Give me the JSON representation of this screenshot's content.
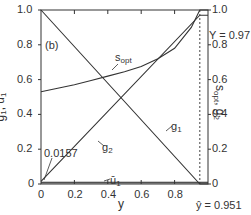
{
  "chart_data": {
    "type": "line",
    "panel_label": "(b)",
    "xlabel": "y",
    "ylabel_left": "g1, ū1",
    "ylabel_right": "s_opt, g2",
    "xlim": [
      0,
      1.0
    ],
    "ylim_left": [
      0,
      1.0
    ],
    "ylim_right": [
      0,
      1.0
    ],
    "x_ticks": [
      "0",
      "0.2",
      "0.4",
      "0.6",
      "0.8"
    ],
    "y_ticks_left": [
      "0",
      "0.2",
      "0.4",
      "0.6",
      "0.8",
      "1.0"
    ],
    "y_ticks_right": [
      "0",
      "0.2",
      "0.4",
      "0.6",
      "0.8",
      "1.0"
    ],
    "grid": false,
    "series": [
      {
        "name": "g1",
        "axis": "left",
        "x": [
          0,
          0.951,
          1.0
        ],
        "values": [
          1.0,
          0.0,
          0.0
        ]
      },
      {
        "name": "g2",
        "axis": "right",
        "x": [
          0,
          0.951,
          1.0
        ],
        "values": [
          0.0157,
          0.97,
          0.97
        ]
      },
      {
        "name": "s_opt",
        "axis": "right",
        "x": [
          0,
          0.1,
          0.2,
          0.3,
          0.4,
          0.5,
          0.6,
          0.7,
          0.8,
          0.9,
          0.951,
          1.0
        ],
        "values": [
          0.53,
          0.55,
          0.57,
          0.595,
          0.62,
          0.645,
          0.675,
          0.72,
          0.78,
          0.9,
          1.0,
          1.0
        ]
      },
      {
        "name": "ū1",
        "axis": "left",
        "x": [
          0,
          1.0
        ],
        "values": [
          0.01,
          0.01
        ]
      }
    ],
    "annotations": [
      {
        "text": "0.0157",
        "target": "g2 at y=0"
      },
      {
        "text": "Y = 0.97",
        "target": "g2 plateau"
      },
      {
        "text": "ŷ = 0.951",
        "target": "dashed vertical line"
      }
    ],
    "vline_x": 0.951
  },
  "labels": {
    "panel": "(b)",
    "x_axis": "y",
    "left_axis_main": "g",
    "left_axis_sub1": "1",
    "left_axis_sep": ", ū",
    "left_axis_sub2": "1",
    "right_axis_main": "s",
    "right_axis_sub1": "opt",
    "right_axis_sep": ", g",
    "right_axis_sub2": "2",
    "s_opt_main": "s",
    "s_opt_sub": "opt",
    "g1_main": "g",
    "g1_sub": "1",
    "g2_main": "g",
    "g2_sub": "2",
    "u1_main": "ū",
    "u1_sub": "1",
    "g2_start": "0.0157",
    "Y_value": "Y = 0.97",
    "yhat_value": "ŷ = 0.951",
    "x_ticks": [
      "0",
      "0.2",
      "0.4",
      "0.6",
      "0.8"
    ],
    "y_ticks_left": [
      "0",
      "0.2",
      "0.4",
      "0.6",
      "0.8",
      "1.0"
    ],
    "y_ticks_right": [
      "0",
      "0.2",
      "0.4",
      "0.6",
      "0.8",
      "1.0"
    ]
  }
}
